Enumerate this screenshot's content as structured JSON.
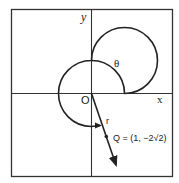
{
  "diagram": {
    "type": "polar-coordinate-plot",
    "labels": {
      "y_axis": "y",
      "x_axis": "x",
      "origin": "O",
      "angle": "θ",
      "radius": "r",
      "point": "Q = (1, −2√2)"
    },
    "point": {
      "name": "Q",
      "x": "1",
      "y": "−2√2"
    },
    "colors": {
      "stroke": "#222222",
      "background": "#ffffff"
    }
  }
}
